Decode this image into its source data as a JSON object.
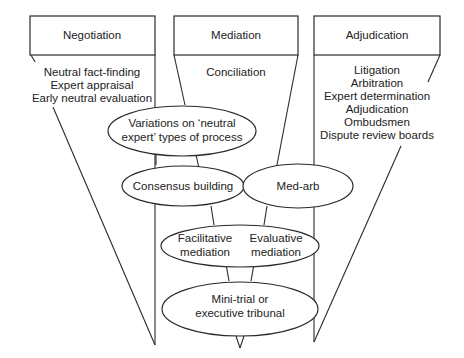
{
  "columns": [
    {
      "title": "Negotiation",
      "items": [
        "Neutral fact-finding",
        "Expert appraisal",
        "Early neutral evaluation"
      ]
    },
    {
      "title": "Mediation",
      "items": [
        "Conciliation"
      ]
    },
    {
      "title": "Adjudication",
      "items": [
        "Litigation",
        "Arbitration",
        "Expert determination",
        "Adjudication",
        "Ombudsmen",
        "Dispute review boards"
      ]
    }
  ],
  "ellipses": {
    "variations": [
      "Variations on ‘neutral",
      "expert’ types of process"
    ],
    "consensus": "Consensus building",
    "medarb": "Med-arb",
    "facilitative": [
      "Facilitative",
      "mediation"
    ],
    "evaluative": [
      "Evaluative",
      "mediation"
    ],
    "minitrial": [
      "Mini-trial or",
      "executive tribunal"
    ]
  }
}
